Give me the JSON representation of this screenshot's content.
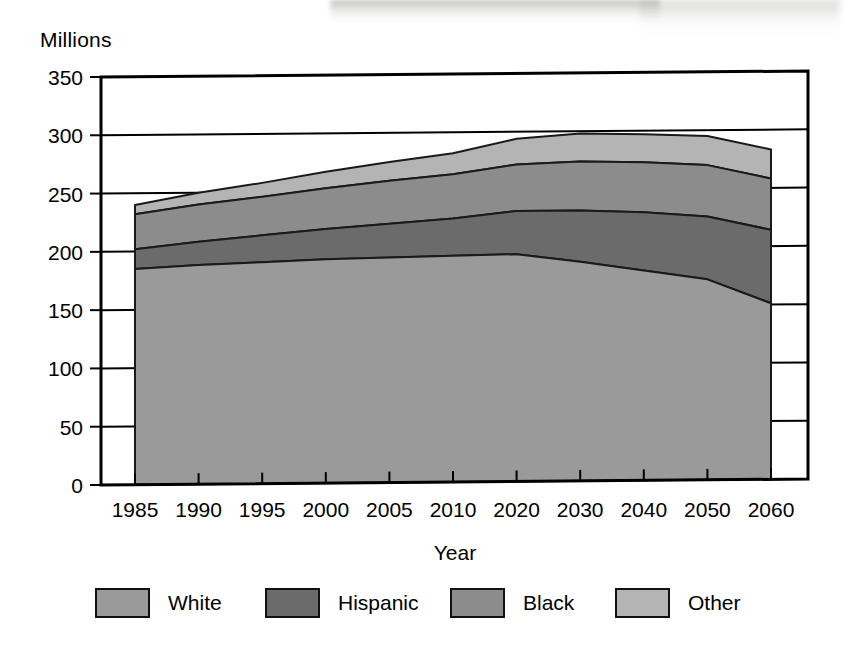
{
  "chart_data": {
    "type": "area",
    "stacked": true,
    "title": "",
    "subtitle": "",
    "xlabel": "Year",
    "ylabel": "Millions",
    "ylabel_position": "top-left",
    "grid": true,
    "grid_axis": "y",
    "legend_position": "bottom",
    "x": [
      1985,
      1990,
      1995,
      2000,
      2005,
      2010,
      2020,
      2030,
      2040,
      2050,
      2060
    ],
    "x_tick_labels": [
      "1985",
      "1990",
      "1995",
      "2000",
      "2005",
      "2010",
      "2020",
      "2030",
      "2040",
      "2050",
      "2060"
    ],
    "y_tick_labels": [
      "0",
      "50",
      "100",
      "150",
      "200",
      "250",
      "300",
      "350"
    ],
    "y_ticks": [
      0,
      50,
      100,
      150,
      200,
      250,
      300,
      350
    ],
    "ylim": [
      0,
      350
    ],
    "series": [
      {
        "name": "White",
        "color": "#9a9a9a",
        "stack_order": 1,
        "values": [
          185,
          188,
          190,
          192,
          193,
          194,
          195,
          188,
          180,
          172,
          151
        ]
      },
      {
        "name": "Hispanic",
        "color": "#6b6b6b",
        "stack_order": 2,
        "values": [
          17,
          20,
          23,
          26,
          29,
          32,
          37,
          44,
          50,
          54,
          63
        ]
      },
      {
        "name": "Black",
        "color": "#8c8c8c",
        "stack_order": 3,
        "values": [
          30,
          32,
          33,
          35,
          37,
          38,
          40,
          42,
          43,
          44,
          44
        ]
      },
      {
        "name": "Other",
        "color": "#b4b4b4",
        "stack_order": 4,
        "values": [
          8,
          10,
          12,
          14,
          16,
          18,
          22,
          24,
          24,
          25,
          25
        ]
      }
    ],
    "cumulative_totals": [
      240,
      250,
      258,
      267,
      275,
      282,
      294,
      298,
      297,
      295,
      283
    ],
    "cumulative_boundaries": {
      "white_top": [
        185,
        188,
        190,
        192,
        193,
        194,
        195,
        188,
        180,
        172,
        151
      ],
      "hispanic_top": [
        202,
        208,
        213,
        218,
        222,
        226,
        232,
        232,
        230,
        226,
        214
      ],
      "black_top": [
        232,
        240,
        246,
        253,
        259,
        264,
        272,
        274,
        273,
        270,
        258
      ],
      "other_top": [
        240,
        250,
        258,
        267,
        275,
        282,
        294,
        298,
        297,
        295,
        283
      ]
    }
  },
  "legend": {
    "items": [
      {
        "label": "White",
        "color": "#9a9a9a"
      },
      {
        "label": "Hispanic",
        "color": "#6b6b6b"
      },
      {
        "label": "Black",
        "color": "#8c8c8c"
      },
      {
        "label": "Other",
        "color": "#b4b4b4"
      }
    ]
  },
  "axis": {
    "unit_label": "Millions",
    "x_title": "Year"
  },
  "colors": {
    "background": "#ffffff",
    "foreground": "#000000",
    "white_band": "#9a9a9a",
    "hispanic_band": "#6b6b6b",
    "black_band": "#8c8c8c",
    "other_band": "#b4b4b4"
  }
}
